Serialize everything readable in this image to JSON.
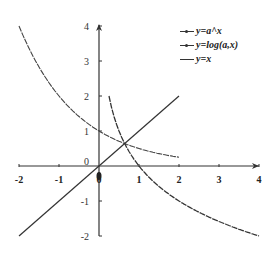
{
  "chart_data": {
    "type": "line",
    "title": "",
    "xlabel": "",
    "ylabel": "",
    "xlim": [
      -2,
      4
    ],
    "ylim": [
      -2,
      4
    ],
    "grid": false,
    "legend_position": "top-right",
    "x_ticks": [
      "-2",
      "-1",
      "0",
      "1",
      "2",
      "3",
      "4"
    ],
    "y_ticks": [
      "-2",
      "-1",
      "0",
      "1",
      "2",
      "3",
      "4"
    ],
    "origin_label": "0",
    "series": [
      {
        "name": "y=a^x",
        "marker": "small-dots",
        "x": [
          -2,
          -1.5,
          -1,
          -0.5,
          0,
          0.5,
          1,
          1.5,
          2
        ],
        "values": [
          4,
          2.83,
          2,
          1.41,
          1,
          0.71,
          0.5,
          0.35,
          0.25
        ]
      },
      {
        "name": "y=log(a,x)",
        "marker": "small-dots",
        "x": [
          0.25,
          0.5,
          0.75,
          1,
          1.5,
          2,
          2.5,
          3,
          3.5,
          4
        ],
        "values": [
          2,
          1,
          0.42,
          0,
          -0.58,
          -1,
          -1.32,
          -1.58,
          -1.81,
          -2
        ]
      },
      {
        "name": "y=x",
        "marker": "none",
        "x": [
          -2,
          2
        ],
        "values": [
          -2,
          2
        ]
      }
    ],
    "annotations": [
      "a = 0.5 implied by curve values"
    ]
  },
  "legend": {
    "items": [
      {
        "label": "y=a^x"
      },
      {
        "label": "y=log(a,x)"
      },
      {
        "label": "y=x"
      }
    ]
  }
}
